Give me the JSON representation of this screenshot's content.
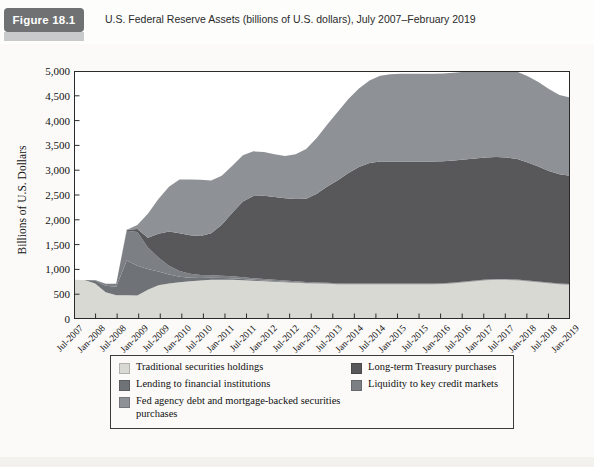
{
  "figure": {
    "badge_label": "Figure 18.1",
    "title": "U.S. Federal Reserve Assets (billions of U.S. dollars), July 2007–February 2019"
  },
  "colors": {
    "traditional": "#d9d9d4",
    "lending": "#6f7277",
    "fed_agency": "#8e9196",
    "longterm_treasury": "#58585a",
    "liquidity": "#7c7f84",
    "axis": "#2a2a2a",
    "badge": "#6f7173",
    "page_bg": "#fbfaf8"
  },
  "legend": {
    "left_column": [
      {
        "label": "Traditional securities holdings",
        "color_key": "traditional"
      },
      {
        "label": "Lending to financial institutions",
        "color_key": "lending"
      },
      {
        "label": "Fed agency debt and mortgage-backed securities purchases",
        "color_key": "fed_agency"
      }
    ],
    "right_column": [
      {
        "label": "Long-term Treasury purchases",
        "color_key": "longterm_treasury"
      },
      {
        "label": "Liquidity to key credit markets",
        "color_key": "liquidity"
      }
    ]
  },
  "chart_data": {
    "type": "area",
    "stacked": true,
    "title": "U.S. Federal Reserve Assets (billions of U.S. dollars), July 2007–February 2019",
    "xlabel": "",
    "ylabel": "Billions of U.S. Dollars",
    "ylim": [
      0,
      5000
    ],
    "ytick_values": [
      0,
      500,
      1000,
      1500,
      2000,
      2500,
      3000,
      3500,
      4000,
      4500,
      5000
    ],
    "ytick_labels": [
      "0",
      "500",
      "1,000",
      "1,500",
      "2,000",
      "2,500",
      "3,000",
      "3,500",
      "4,000",
      "4,500",
      "5,000"
    ],
    "grid": false,
    "legend_position": "below-plot",
    "xtick_labels": [
      "Jul-2007",
      "Jan-2008",
      "Jul-2008",
      "Jan-2009",
      "Jul-2009",
      "Jan-2010",
      "Jul-2010",
      "Jan-2011",
      "Jul-2011",
      "Jan-2012",
      "Jul-2012",
      "Jan-2013",
      "Jul-2013",
      "Jan-2014",
      "Jul-2014",
      "Jan-2015",
      "Jul-2015",
      "Jan-2016",
      "Jul-2016",
      "Jan-2017",
      "Jul-2017",
      "Jan-2018",
      "Jul-2018",
      "Jan-2019"
    ],
    "x": [
      "Jul-2007",
      "Oct-2007",
      "Jan-2008",
      "Apr-2008",
      "Jul-2008",
      "Oct-2008",
      "Jan-2009",
      "Apr-2009",
      "Jul-2009",
      "Oct-2009",
      "Jan-2010",
      "Apr-2010",
      "Jul-2010",
      "Oct-2010",
      "Jan-2011",
      "Apr-2011",
      "Jul-2011",
      "Oct-2011",
      "Jan-2012",
      "Apr-2012",
      "Jul-2012",
      "Oct-2012",
      "Jan-2013",
      "Apr-2013",
      "Jul-2013",
      "Oct-2013",
      "Jan-2014",
      "Apr-2014",
      "Jul-2014",
      "Oct-2014",
      "Jan-2015",
      "Apr-2015",
      "Jul-2015",
      "Oct-2015",
      "Jan-2016",
      "Apr-2016",
      "Jul-2016",
      "Oct-2016",
      "Jan-2017",
      "Apr-2017",
      "Jul-2017",
      "Oct-2017",
      "Jan-2018",
      "Apr-2018",
      "Jul-2018",
      "Oct-2018",
      "Jan-2019",
      "Feb-2019"
    ],
    "series": [
      {
        "name": "Traditional securities holdings",
        "color_key": "traditional",
        "values": [
          790,
          785,
          715,
          540,
          480,
          480,
          475,
          590,
          680,
          715,
          740,
          760,
          775,
          790,
          790,
          790,
          780,
          770,
          760,
          750,
          740,
          730,
          720,
          715,
          710,
          700,
          700,
          700,
          700,
          700,
          700,
          700,
          700,
          700,
          700,
          705,
          720,
          740,
          760,
          780,
          790,
          790,
          780,
          760,
          740,
          720,
          700,
          690
        ]
      },
      {
        "name": "Lending to financial institutions",
        "color_key": "lending",
        "values": [
          0,
          0,
          60,
          130,
          170,
          700,
          600,
          420,
          280,
          180,
          110,
          70,
          50,
          40,
          35,
          30,
          25,
          20,
          18,
          15,
          12,
          10,
          8,
          6,
          5,
          5,
          4,
          4,
          4,
          4,
          4,
          4,
          4,
          4,
          4,
          4,
          4,
          4,
          4,
          4,
          4,
          4,
          4,
          4,
          4,
          4,
          4,
          4
        ]
      },
      {
        "name": "Liquidity to key credit markets",
        "color_key": "liquidity",
        "values": [
          0,
          0,
          10,
          40,
          60,
          600,
          680,
          430,
          280,
          180,
          120,
          80,
          60,
          50,
          45,
          40,
          35,
          30,
          28,
          25,
          22,
          20,
          18,
          16,
          15,
          14,
          12,
          12,
          12,
          12,
          12,
          12,
          12,
          12,
          12,
          12,
          12,
          12,
          12,
          12,
          12,
          12,
          12,
          12,
          12,
          12,
          12,
          12
        ]
      },
      {
        "name": "Long-term Treasury purchases",
        "color_key": "longterm_treasury",
        "values": [
          0,
          0,
          0,
          0,
          0,
          20,
          60,
          200,
          480,
          690,
          760,
          780,
          790,
          850,
          1030,
          1280,
          1530,
          1660,
          1680,
          1670,
          1660,
          1660,
          1680,
          1790,
          1940,
          2080,
          2230,
          2350,
          2430,
          2460,
          2460,
          2460,
          2460,
          2460,
          2460,
          2460,
          2460,
          2460,
          2460,
          2460,
          2460,
          2450,
          2430,
          2380,
          2320,
          2250,
          2200,
          2180
        ]
      },
      {
        "name": "Fed agency debt and mortgage-backed securities purchases",
        "color_key": "fed_agency",
        "values": [
          0,
          0,
          0,
          0,
          0,
          0,
          80,
          480,
          700,
          900,
          1080,
          1120,
          1130,
          1060,
          990,
          950,
          930,
          900,
          880,
          860,
          850,
          900,
          1000,
          1120,
          1250,
          1380,
          1490,
          1580,
          1660,
          1730,
          1760,
          1770,
          1770,
          1770,
          1770,
          1770,
          1770,
          1770,
          1770,
          1770,
          1770,
          1770,
          1760,
          1740,
          1700,
          1650,
          1600,
          1580
        ]
      }
    ],
    "totals_note": {
      "start_2007": 870,
      "crisis_peak_2008_2009": 2250,
      "plateau_2015_2017": 4500,
      "end_2019": 4000
    }
  }
}
